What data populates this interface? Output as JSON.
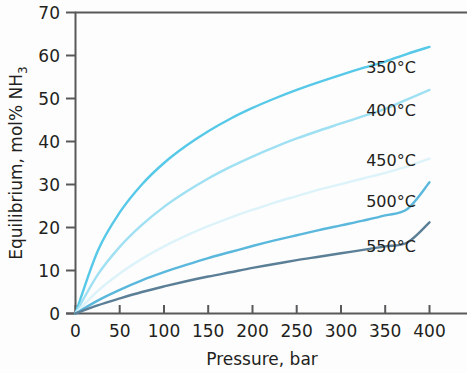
{
  "chart_data": {
    "type": "line",
    "title": "",
    "subtitle": "",
    "xlabel": "Pressure, bar",
    "ylabel": "Equilibrium, mol% NH3",
    "ylabel_main": "Equilibrium, mol% NH",
    "ylabel_sub": "3",
    "xlim": [
      0,
      420
    ],
    "ylim": [
      0,
      70
    ],
    "xticks": [
      0,
      50,
      100,
      150,
      200,
      250,
      300,
      350,
      400
    ],
    "xtick_labels": [
      "0",
      "50",
      "100",
      "150",
      "200",
      "250",
      "300",
      "350",
      "400"
    ],
    "yticks": [
      0,
      10,
      20,
      30,
      40,
      50,
      60,
      70
    ],
    "ytick_labels": [
      "0",
      "10",
      "20",
      "30",
      "40",
      "50",
      "60",
      "70"
    ],
    "grid": false,
    "legend_position": "inline-right",
    "x": [
      0,
      25,
      50,
      75,
      100,
      125,
      150,
      175,
      200,
      225,
      250,
      275,
      300,
      325,
      350,
      375,
      400
    ],
    "series": [
      {
        "name": "350°C",
        "label": "350°C",
        "color": "#56c8e8",
        "values": [
          0,
          14.5,
          23.5,
          30.0,
          35.0,
          39.0,
          42.4,
          45.3,
          47.8,
          50.0,
          52.0,
          53.8,
          55.5,
          57.1,
          58.6,
          60.4,
          62.0
        ],
        "label_pos": {
          "x": 391,
          "y": 73
        }
      },
      {
        "name": "400°C",
        "label": "400°C",
        "color": "#9fe0f2",
        "values": [
          0,
          9.0,
          15.5,
          20.6,
          24.8,
          28.3,
          31.4,
          34.1,
          36.5,
          38.7,
          40.7,
          42.5,
          44.2,
          45.9,
          47.6,
          49.8,
          52.0
        ],
        "label_pos": {
          "x": 391,
          "y": 116
        }
      },
      {
        "name": "450°C",
        "label": "450°C",
        "color": "#ddf3fa",
        "values": [
          0,
          5.2,
          9.3,
          12.7,
          15.6,
          18.1,
          20.3,
          22.3,
          24.1,
          25.8,
          27.3,
          28.8,
          30.1,
          31.4,
          32.7,
          34.2,
          36.0
        ],
        "label_pos": {
          "x": 391,
          "y": 166
        }
      },
      {
        "name": "500°C",
        "label": "500°C",
        "color": "#5bb8dd",
        "values": [
          0,
          3.0,
          5.5,
          7.7,
          9.6,
          11.3,
          12.9,
          14.3,
          15.7,
          17.0,
          18.2,
          19.4,
          20.5,
          21.6,
          22.8,
          24.3,
          30.5
        ],
        "label_pos": {
          "x": 391,
          "y": 207
        }
      },
      {
        "name": "550°C",
        "label": "550°C",
        "color": "#5b7f96",
        "values": [
          0,
          1.9,
          3.5,
          5.0,
          6.3,
          7.5,
          8.6,
          9.6,
          10.6,
          11.5,
          12.4,
          13.2,
          14.0,
          14.8,
          15.6,
          16.5,
          21.2
        ],
        "label_pos": {
          "x": 391,
          "y": 252
        }
      }
    ]
  },
  "axes": {
    "frame_color": "#58595b",
    "tick_color": "#58595b"
  }
}
